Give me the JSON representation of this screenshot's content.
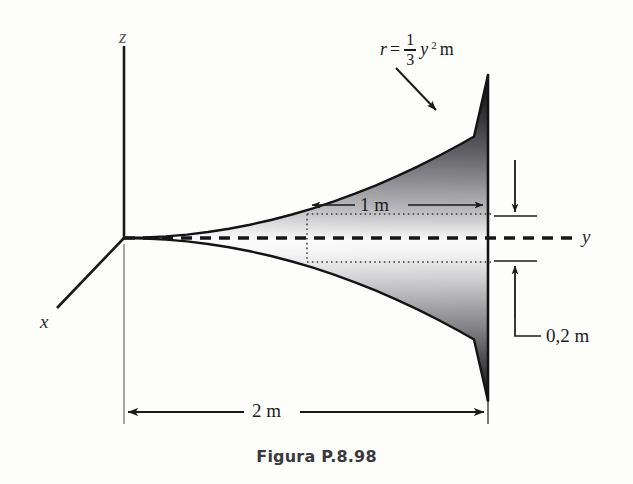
{
  "figure": {
    "caption": "Figura P.8.98",
    "caption_y": 447,
    "axes": {
      "z_label": "z",
      "x_label": "x",
      "y_label": "y",
      "origin": {
        "x": 124,
        "y": 238
      }
    },
    "equation": {
      "lhs": "r",
      "equals": "=",
      "numerator": "1",
      "denominator": "3",
      "variable": "y",
      "exponent": "2",
      "unit": "m",
      "full_text": "r = 1/3 y² m"
    },
    "dimensions": [
      {
        "name": "overall-length",
        "label": "2 m",
        "value": 2,
        "unit": "m",
        "orientation": "horizontal"
      },
      {
        "name": "segment-length",
        "label": "1 m",
        "value": 1,
        "unit": "m",
        "orientation": "horizontal"
      },
      {
        "name": "segment-thickness",
        "label": "0,2 m",
        "value": 0.2,
        "unit": "m",
        "orientation": "vertical"
      }
    ],
    "colors": {
      "ink": "#1a1a1d",
      "curve": "#16161a",
      "shade_dark": "#1e1e20",
      "shade_mid": "#8e8e92",
      "shade_light": "#fbfbfb",
      "paper": "#fdfdfc"
    },
    "geometry": {
      "horn_tip_x": 124,
      "horn_end_x": 488,
      "horn_axis_y": 238,
      "horn_half_height_end": 163,
      "profile_exponent": 2,
      "dotted_cyl_x1": 307,
      "dotted_cyl_x2": 488,
      "dotted_cyl_half_height": 24
    }
  }
}
